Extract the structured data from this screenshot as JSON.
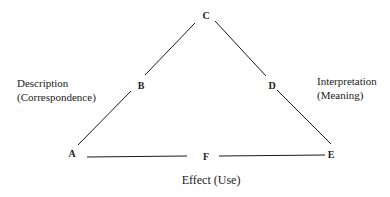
{
  "diagram": {
    "type": "triangle",
    "line_color": "#1a1a1a",
    "nodes": [
      {
        "id": "A",
        "label": "A",
        "x": 72,
        "y": 154
      },
      {
        "id": "B",
        "label": "B",
        "x": 141,
        "y": 86
      },
      {
        "id": "C",
        "label": "C",
        "x": 206,
        "y": 16
      },
      {
        "id": "D",
        "label": "D",
        "x": 272,
        "y": 86
      },
      {
        "id": "E",
        "label": "E",
        "x": 331,
        "y": 155
      },
      {
        "id": "F",
        "label": "F",
        "x": 206,
        "y": 157
      }
    ],
    "edges": [
      {
        "from": "C",
        "to": "B"
      },
      {
        "from": "B",
        "to": "A"
      },
      {
        "from": "C",
        "to": "D"
      },
      {
        "from": "D",
        "to": "E"
      },
      {
        "from": "A",
        "to": "F"
      },
      {
        "from": "F",
        "to": "E"
      }
    ],
    "side_labels": {
      "left": {
        "line1": "Description",
        "line2": "(Correspondence)"
      },
      "right": {
        "line1": "Interpretation",
        "line2": "(Meaning)"
      },
      "bottom": {
        "line1": "Effect (Use)"
      }
    }
  }
}
